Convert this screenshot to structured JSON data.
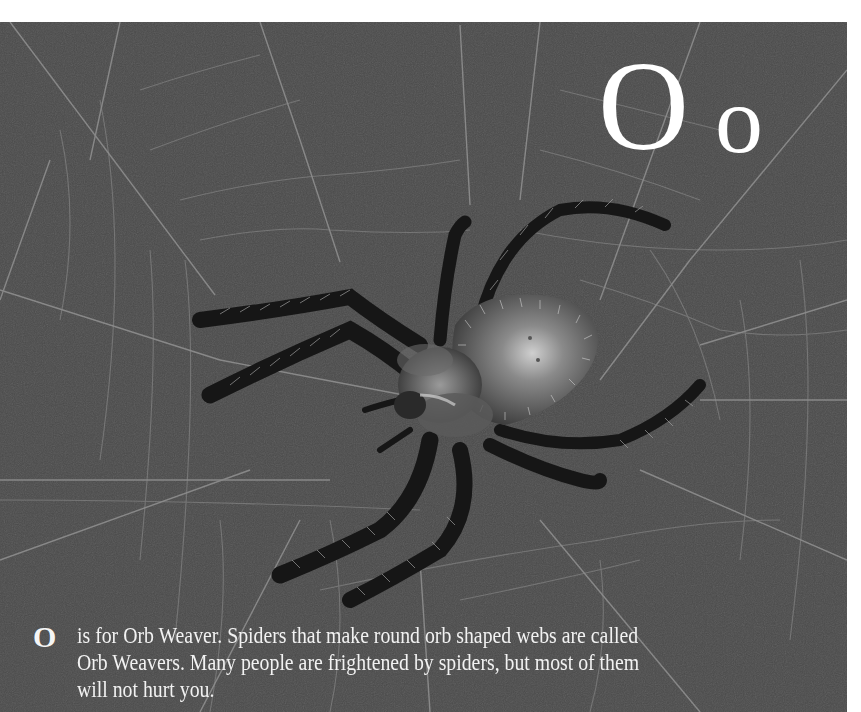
{
  "page": {
    "background_color": "#4a4a4a",
    "margin_color": "#ffffff",
    "text_color": "#ffffff"
  },
  "heading": {
    "uppercase": "O",
    "lowercase": "o"
  },
  "caption": {
    "initial": "O",
    "lines": [
      "is for Orb Weaver. Spiders that make round orb shaped webs are called",
      "Orb Weavers. Many people are frightened by spiders, but most of them",
      "will not hurt you."
    ]
  },
  "illustration": {
    "subject": "orb weaver spider on web",
    "icon": "spider-illustration"
  }
}
